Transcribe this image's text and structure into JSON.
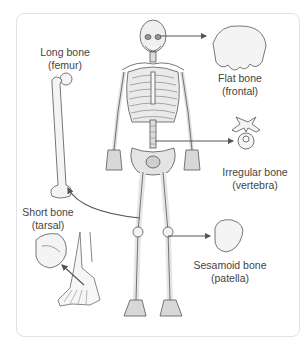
{
  "diagram": {
    "title": "",
    "colors": {
      "card_border": "#e2e2e2",
      "bone_fill": "#f2f2f2",
      "bone_stroke": "#555555",
      "arrow": "#555555",
      "text": "#444444"
    },
    "labels": [
      {
        "id": "long",
        "name": "Long bone",
        "example": "(femur)"
      },
      {
        "id": "flat",
        "name": "Flat bone",
        "example": "(frontal)"
      },
      {
        "id": "irregular",
        "name": "Irregular bone",
        "example": "(vertebra)"
      },
      {
        "id": "short",
        "name": "Short bone",
        "example": "(tarsal)"
      },
      {
        "id": "sesamoid",
        "name": "Sesamoid bone",
        "example": "(patella)"
      }
    ],
    "arrows": [
      {
        "from": "skull",
        "to": "flat"
      },
      {
        "from": "lumbar-spine",
        "to": "irregular"
      },
      {
        "from": "thigh",
        "to": "long"
      },
      {
        "from": "knee",
        "to": "sesamoid"
      },
      {
        "from": "foot",
        "to": "short"
      }
    ]
  }
}
